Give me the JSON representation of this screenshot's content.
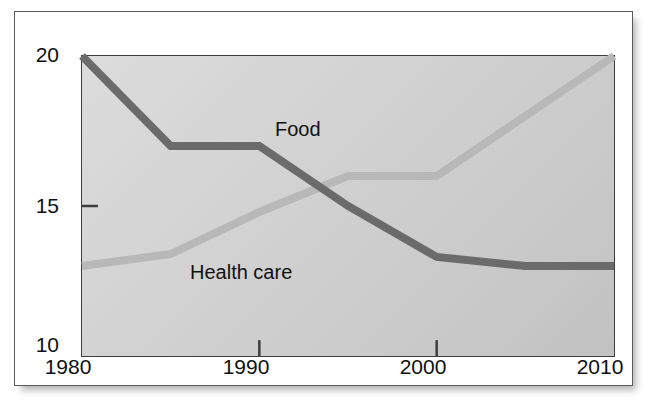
{
  "figure": {
    "title_partial": "",
    "background_color": "#ffffff",
    "frame_color": "#5a5a5a",
    "plot_bg_top": "#dcdcdc",
    "plot_bg_bottom": "#c2c2c2",
    "axis_color": "#3d3d3d"
  },
  "chart_data": {
    "type": "line",
    "title": "",
    "xlabel": "",
    "ylabel": "",
    "x": [
      1980,
      1985,
      1990,
      1995,
      2000,
      2005,
      2010
    ],
    "xlim": [
      1980,
      2010
    ],
    "ylim": [
      10,
      20
    ],
    "xticks": [
      1980,
      1990,
      2000,
      2010
    ],
    "xtick_labels": [
      "1980",
      "1990",
      "2000",
      "2010"
    ],
    "yticks": [
      10,
      15,
      20
    ],
    "ytick_labels": [
      "10",
      "15",
      "20"
    ],
    "grid": false,
    "legend_position": "inline-annotations",
    "series": [
      {
        "name": "Food",
        "color": "#6b6b6b",
        "line_width": 7,
        "values": [
          20,
          17,
          17,
          15,
          13.3,
          13,
          13
        ],
        "label_text": "Food"
      },
      {
        "name": "Health care",
        "color": "#b8b8b8",
        "line_width": 7,
        "values": [
          13,
          13.4,
          14.8,
          16,
          16,
          18,
          20
        ],
        "label_text": "Health care"
      }
    ],
    "annotations": [
      {
        "text": "Food",
        "x": 1991.5,
        "y": 18.1
      },
      {
        "text": "Health care",
        "x": 1987.0,
        "y": 13.25
      }
    ],
    "crossover": {
      "x": 1994,
      "y": 15.8
    }
  }
}
